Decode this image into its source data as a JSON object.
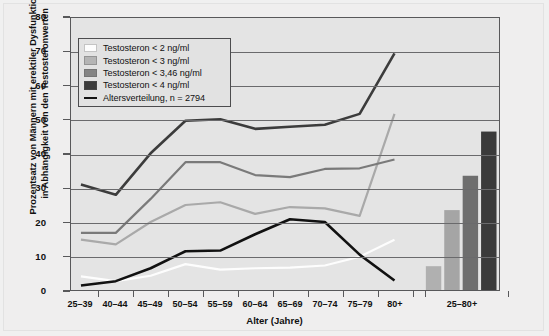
{
  "chart_data": {
    "type": "line",
    "title": "",
    "xlabel": "Alter (Jahre)",
    "ylabel": "Prozentsatz von Männern mit erektiler Dysfunktion in Abhängigkeit von den Testosteronwerten",
    "ylabel_line1": "Prozentsatz von Männern mit erektiler Dysfunktion",
    "ylabel_line2": "in Abhängigkeit von den Testosteronwerten",
    "ylim": [
      0,
      80
    ],
    "yticks": [
      0,
      10,
      20,
      30,
      40,
      50,
      60,
      70,
      80
    ],
    "grid": true,
    "legend_position": "top-left inside",
    "categories": [
      "25–39",
      "40–44",
      "45–49",
      "50–54",
      "55–59",
      "60–64",
      "65–69",
      "70–74",
      "75–79",
      "80+"
    ],
    "bar_category": "25–80+",
    "series": [
      {
        "name": "Testosteron < 2 ng/ml",
        "color": "#fdfdfd",
        "kind": "line",
        "values": [
          4.0,
          2.6,
          4.2,
          7.6,
          6.0,
          6.4,
          6.6,
          7.2,
          9.8,
          14.8
        ],
        "bar_value": 7.0
      },
      {
        "name": "Testosteron < 3 ng/ml",
        "color": "#a9a9a9",
        "kind": "line",
        "values": [
          14.8,
          13.4,
          20.0,
          25.0,
          25.8,
          22.4,
          24.4,
          24.0,
          21.8,
          51.8
        ],
        "bar_value": 23.5
      },
      {
        "name": "Testosteron < 3,46 ng/ml",
        "color": "#7a7a7a",
        "kind": "line",
        "values": [
          16.8,
          16.8,
          26.8,
          37.6,
          37.6,
          33.8,
          33.2,
          35.6,
          35.8,
          38.4
        ],
        "bar_value": 33.6
      },
      {
        "name": "Testosteron < 4 ng/ml",
        "color": "#3c3c3c",
        "kind": "line",
        "values": [
          31.0,
          28.0,
          40.2,
          49.8,
          50.2,
          47.4,
          48.0,
          48.6,
          51.8,
          69.6
        ],
        "bar_value": 46.6
      },
      {
        "name": "Altersverteilung, n = 2794",
        "color": "#111111",
        "kind": "line",
        "values": [
          1.3,
          2.6,
          6.4,
          11.4,
          11.6,
          16.4,
          20.8,
          20.0,
          10.4,
          2.8
        ],
        "bar_value": null
      }
    ],
    "bars": [
      {
        "label": "Testosteron < 2 ng/ml",
        "value": 7.0,
        "color": "#b0b0b0"
      },
      {
        "label": "Testosteron < 3 ng/ml",
        "value": 23.5,
        "color": "#a5a5a5"
      },
      {
        "label": "Testosteron < 3,46 ng/ml",
        "value": 33.6,
        "color": "#6e6e6e"
      },
      {
        "label": "Testosteron < 4 ng/ml",
        "value": 46.6,
        "color": "#3a3a3a"
      }
    ],
    "legend": [
      {
        "label": "Testosteron < 2 ng/ml",
        "swatch": "#fdfdfd",
        "type": "box"
      },
      {
        "label": "Testosteron < 3 ng/ml",
        "swatch": "#b4b4b4",
        "type": "box"
      },
      {
        "label": "Testosteron < 3,46 ng/ml",
        "swatch": "#848484",
        "type": "box"
      },
      {
        "label": "Testosteron < 4 ng/ml",
        "swatch": "#3c3c3c",
        "type": "box"
      },
      {
        "label": "Altersverteilung, n = 2794",
        "swatch": "#141414",
        "type": "line"
      }
    ]
  }
}
